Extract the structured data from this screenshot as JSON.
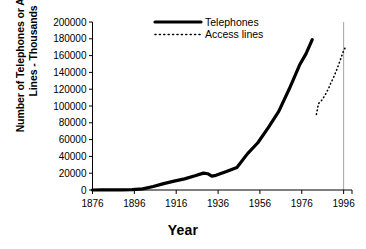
{
  "chart_data": {
    "type": "line",
    "title": "",
    "xlabel": "Year",
    "ylabel": "Number of Telephones or Access Lines - Thousands",
    "ylabel_line1": "Number of Telephones or Access",
    "ylabel_line2": "Lines - Thousands",
    "xlim": [
      1876,
      2000
    ],
    "ylim": [
      0,
      200000
    ],
    "xticks": [
      1876,
      1896,
      1916,
      1936,
      1956,
      1976,
      1996
    ],
    "xticklabels": [
      "1876",
      "1896",
      "1916",
      "1936",
      "1956",
      "1976",
      "1996"
    ],
    "yticks": [
      0,
      20000,
      40000,
      60000,
      80000,
      100000,
      120000,
      140000,
      160000,
      180000,
      200000
    ],
    "yticklabels": [
      "0",
      "20000",
      "40000",
      "60000",
      "80000",
      "100000",
      "120000",
      "140000",
      "160000",
      "180000",
      "200000"
    ],
    "grid": false,
    "gridline_x": 1996,
    "legend_position": "top-center",
    "series": [
      {
        "name": "Telephones",
        "style": "solid",
        "color": "#000000",
        "width": 3.2,
        "points": [
          [
            1876,
            0
          ],
          [
            1880,
            50
          ],
          [
            1885,
            150
          ],
          [
            1890,
            230
          ],
          [
            1895,
            340
          ],
          [
            1900,
            1356
          ],
          [
            1905,
            4127
          ],
          [
            1910,
            7635
          ],
          [
            1915,
            10524
          ],
          [
            1920,
            13273
          ],
          [
            1925,
            16875
          ],
          [
            1929,
            20068
          ],
          [
            1931,
            19382
          ],
          [
            1933,
            16500
          ],
          [
            1935,
            17424
          ],
          [
            1940,
            21928
          ],
          [
            1945,
            26866
          ],
          [
            1950,
            43004
          ],
          [
            1955,
            56243
          ],
          [
            1960,
            74342
          ],
          [
            1965,
            93656
          ],
          [
            1970,
            120218
          ],
          [
            1975,
            149011
          ],
          [
            1978,
            162070
          ],
          [
            1981,
            179000
          ]
        ]
      },
      {
        "name": "Access lines",
        "style": "dotted",
        "color": "#000000",
        "width": 1.6,
        "points": [
          [
            1983,
            90000
          ],
          [
            1984,
            103000
          ],
          [
            1985,
            105000
          ],
          [
            1986,
            108500
          ],
          [
            1987,
            112500
          ],
          [
            1988,
            117000
          ],
          [
            1989,
            122000
          ],
          [
            1990,
            128000
          ],
          [
            1991,
            133000
          ],
          [
            1992,
            139000
          ],
          [
            1993,
            145000
          ],
          [
            1994,
            152000
          ],
          [
            1995,
            159000
          ],
          [
            1996,
            166000
          ],
          [
            1997,
            170500
          ]
        ]
      }
    ]
  }
}
